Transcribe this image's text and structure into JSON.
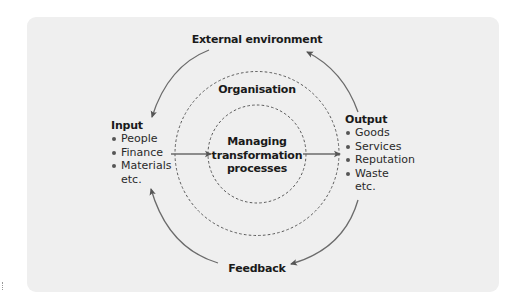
{
  "diagram": {
    "top_label": "External environment",
    "organisation_label": "Organisation",
    "center": {
      "line1": "Managing",
      "line2": "transformation",
      "line3": "processes"
    },
    "bottom_label": "Feedback",
    "input": {
      "heading": "Input",
      "items": [
        "People",
        "Finance",
        "Materials"
      ],
      "trailing": "etc."
    },
    "output": {
      "heading": "Output",
      "items": [
        "Goods",
        "Services",
        "Reputation",
        "Waste"
      ],
      "trailing": "etc."
    },
    "colors": {
      "panel_background": "#efefef",
      "arrow": "#6b6b6b",
      "dashed_circle": "#5a5a5a",
      "text": "#1a1a1a"
    },
    "flow": [
      {
        "from": "Input",
        "to": "Managing transformation processes",
        "type": "straight-arrow"
      },
      {
        "from": "Managing transformation processes",
        "to": "Output",
        "type": "straight-arrow"
      },
      {
        "from": "Output",
        "to": "External environment",
        "type": "curved-arrow"
      },
      {
        "from": "External environment",
        "to": "Input",
        "type": "curved-arrow"
      },
      {
        "from": "Output",
        "to": "Feedback",
        "type": "curved-arrow"
      },
      {
        "from": "Feedback",
        "to": "Input",
        "type": "curved-arrow"
      }
    ]
  }
}
